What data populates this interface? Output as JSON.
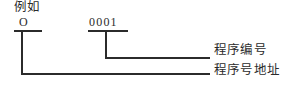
{
  "figure": {
    "width": 284,
    "height": 87,
    "background_color": "#ffffff",
    "ink_color": "#2b2b2b",
    "example_label": "例如",
    "code_fields": [
      {
        "id": "address-letter",
        "text": "O",
        "underline": {
          "x1": 14,
          "x2": 42,
          "y": 31
        },
        "stem_x": 22,
        "describes": "程序号地址"
      },
      {
        "id": "number-digits",
        "text": "0001",
        "underline": {
          "x1": 88,
          "x2": 128,
          "y": 31
        },
        "stem_x": 106,
        "describes": "程序编号"
      }
    ],
    "callouts": [
      {
        "id": "program-number",
        "text": "程序编号",
        "leader_y": 58,
        "leader_x1": 106,
        "leader_x2": 210
      },
      {
        "id": "program-number-address",
        "text": "程序号地址",
        "leader_y": 74,
        "leader_x1": 22,
        "leader_x2": 210
      }
    ]
  }
}
